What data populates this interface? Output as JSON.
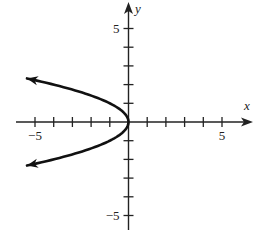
{
  "chart_data": {
    "type": "line",
    "title": "",
    "xlabel": "x",
    "ylabel": "y",
    "xlim": [
      -6,
      6.5
    ],
    "ylim": [
      -6.1,
      6.3
    ],
    "grid": false,
    "x_tick_labels": [
      {
        "value": -5,
        "label": "−5"
      },
      {
        "value": 5,
        "label": "5"
      }
    ],
    "y_tick_labels": [
      {
        "value": 5,
        "label": "5"
      },
      {
        "value": -5,
        "label": "−5"
      }
    ],
    "x_ticks": [
      -5,
      -4,
      -3,
      -2,
      -1,
      1,
      2,
      3,
      4,
      5
    ],
    "y_ticks": [
      -5,
      -4,
      -3,
      -2,
      -1,
      1,
      2,
      3,
      4,
      5
    ],
    "series": [
      {
        "name": "x = -y^2",
        "equation": "x = -y^2",
        "arrows": "both ends",
        "points": [
          {
            "x": -5.43,
            "y": 2.33
          },
          {
            "x": -4.0,
            "y": 2.0
          },
          {
            "x": -2.25,
            "y": 1.5
          },
          {
            "x": -1.0,
            "y": 1.0
          },
          {
            "x": -0.25,
            "y": 0.5
          },
          {
            "x": 0,
            "y": 0
          },
          {
            "x": -0.25,
            "y": -0.5
          },
          {
            "x": -1.0,
            "y": -1.0
          },
          {
            "x": -2.25,
            "y": -1.5
          },
          {
            "x": -4.0,
            "y": -2.0
          },
          {
            "x": -5.43,
            "y": -2.33
          }
        ]
      }
    ]
  },
  "colors": {
    "axis": "#222222",
    "curve": "#111111",
    "background": "#ffffff"
  }
}
